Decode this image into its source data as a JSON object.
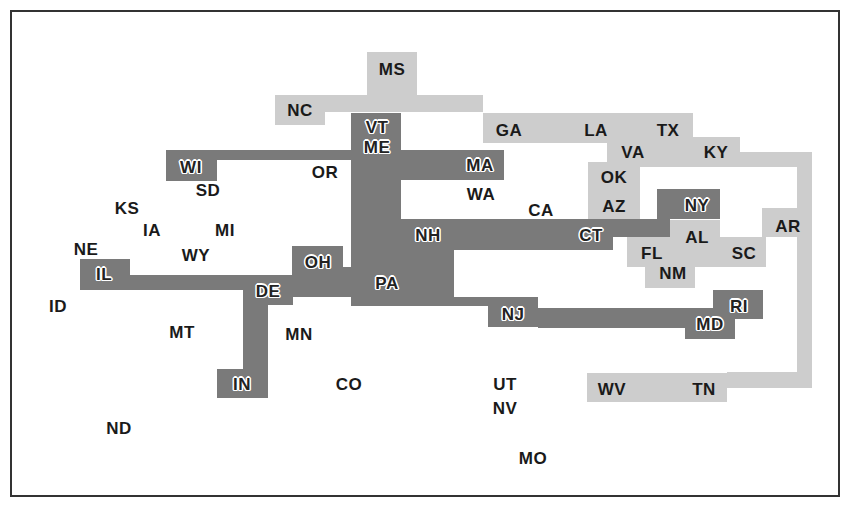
{
  "diagram": {
    "type": "region-cluster-map",
    "colors": {
      "dark_cluster": "#7a7a7a",
      "light_cluster": "#cdcdcd",
      "frame": "#333333",
      "text": "#1a1a1a"
    },
    "shapes": [
      {
        "cluster": "light",
        "x": 367,
        "y": 52,
        "w": 50,
        "h": 45
      },
      {
        "cluster": "light",
        "x": 275,
        "y": 95,
        "w": 208,
        "h": 17
      },
      {
        "cluster": "light",
        "x": 275,
        "y": 95,
        "w": 50,
        "h": 30
      },
      {
        "cluster": "light",
        "x": 483,
        "y": 113,
        "w": 210,
        "h": 30
      },
      {
        "cluster": "light",
        "x": 607,
        "y": 137,
        "w": 133,
        "h": 30
      },
      {
        "cluster": "light",
        "x": 740,
        "y": 152,
        "w": 72,
        "h": 15
      },
      {
        "cluster": "light",
        "x": 797,
        "y": 152,
        "w": 15,
        "h": 236
      },
      {
        "cluster": "light",
        "x": 588,
        "y": 162,
        "w": 52,
        "h": 58
      },
      {
        "cluster": "light",
        "x": 762,
        "y": 208,
        "w": 50,
        "h": 29
      },
      {
        "cluster": "light",
        "x": 670,
        "y": 220,
        "w": 50,
        "h": 47
      },
      {
        "cluster": "light",
        "x": 627,
        "y": 237,
        "w": 45,
        "h": 30
      },
      {
        "cluster": "light",
        "x": 720,
        "y": 237,
        "w": 46,
        "h": 30
      },
      {
        "cluster": "light",
        "x": 645,
        "y": 265,
        "w": 50,
        "h": 23
      },
      {
        "cluster": "light",
        "x": 727,
        "y": 372,
        "w": 85,
        "h": 16
      },
      {
        "cluster": "light",
        "x": 587,
        "y": 373,
        "w": 140,
        "h": 29
      },
      {
        "cluster": "dark",
        "x": 166,
        "y": 150,
        "w": 51,
        "h": 31
      },
      {
        "cluster": "dark",
        "x": 217,
        "y": 150,
        "w": 134,
        "h": 10
      },
      {
        "cluster": "dark",
        "x": 351,
        "y": 113,
        "w": 50,
        "h": 193
      },
      {
        "cluster": "dark",
        "x": 401,
        "y": 150,
        "w": 103,
        "h": 30
      },
      {
        "cluster": "dark",
        "x": 401,
        "y": 219,
        "w": 212,
        "h": 31
      },
      {
        "cluster": "dark",
        "x": 613,
        "y": 219,
        "w": 57,
        "h": 18
      },
      {
        "cluster": "dark",
        "x": 657,
        "y": 189,
        "w": 63,
        "h": 30
      },
      {
        "cluster": "dark",
        "x": 401,
        "y": 250,
        "w": 53,
        "h": 56
      },
      {
        "cluster": "dark",
        "x": 292,
        "y": 246,
        "w": 51,
        "h": 51
      },
      {
        "cluster": "dark",
        "x": 292,
        "y": 267,
        "w": 59,
        "h": 30
      },
      {
        "cluster": "dark",
        "x": 80,
        "y": 259,
        "w": 50,
        "h": 31
      },
      {
        "cluster": "dark",
        "x": 130,
        "y": 275,
        "w": 163,
        "h": 15
      },
      {
        "cluster": "dark",
        "x": 243,
        "y": 275,
        "w": 50,
        "h": 30
      },
      {
        "cluster": "dark",
        "x": 243,
        "y": 305,
        "w": 25,
        "h": 93
      },
      {
        "cluster": "dark",
        "x": 217,
        "y": 369,
        "w": 51,
        "h": 29
      },
      {
        "cluster": "dark",
        "x": 454,
        "y": 297,
        "w": 34,
        "h": 9
      },
      {
        "cluster": "dark",
        "x": 488,
        "y": 297,
        "w": 50,
        "h": 30
      },
      {
        "cluster": "dark",
        "x": 538,
        "y": 308,
        "w": 147,
        "h": 20
      },
      {
        "cluster": "dark",
        "x": 685,
        "y": 308,
        "w": 50,
        "h": 31
      },
      {
        "cluster": "dark",
        "x": 713,
        "y": 290,
        "w": 50,
        "h": 29
      }
    ],
    "labels": [
      {
        "text": "MS",
        "x": 392,
        "y": 69,
        "style": "light"
      },
      {
        "text": "NC",
        "x": 300,
        "y": 110,
        "style": "light"
      },
      {
        "text": "VT",
        "x": 377,
        "y": 127,
        "style": "dark"
      },
      {
        "text": "ME",
        "x": 377,
        "y": 147,
        "style": "dark"
      },
      {
        "text": "GA",
        "x": 509,
        "y": 130,
        "style": "light"
      },
      {
        "text": "LA",
        "x": 596,
        "y": 130,
        "style": "light"
      },
      {
        "text": "TX",
        "x": 668,
        "y": 130,
        "style": "light"
      },
      {
        "text": "VA",
        "x": 633,
        "y": 152,
        "style": "light"
      },
      {
        "text": "KY",
        "x": 716,
        "y": 152,
        "style": "light"
      },
      {
        "text": "WI",
        "x": 191,
        "y": 167,
        "style": "dark"
      },
      {
        "text": "OR",
        "x": 325,
        "y": 172,
        "style": "none"
      },
      {
        "text": "MA",
        "x": 480,
        "y": 165,
        "style": "dark"
      },
      {
        "text": "SD",
        "x": 208,
        "y": 190,
        "style": "none"
      },
      {
        "text": "WA",
        "x": 481,
        "y": 194,
        "style": "none"
      },
      {
        "text": "OK",
        "x": 614,
        "y": 177,
        "style": "light"
      },
      {
        "text": "KS",
        "x": 127,
        "y": 208,
        "style": "none"
      },
      {
        "text": "CA",
        "x": 541,
        "y": 210,
        "style": "none"
      },
      {
        "text": "AZ",
        "x": 614,
        "y": 206,
        "style": "light"
      },
      {
        "text": "NY",
        "x": 697,
        "y": 205,
        "style": "dark"
      },
      {
        "text": "AR",
        "x": 788,
        "y": 226,
        "style": "light"
      },
      {
        "text": "IA",
        "x": 152,
        "y": 230,
        "style": "none"
      },
      {
        "text": "MI",
        "x": 225,
        "y": 230,
        "style": "none"
      },
      {
        "text": "NH",
        "x": 428,
        "y": 235,
        "style": "dark"
      },
      {
        "text": "CT",
        "x": 591,
        "y": 235,
        "style": "dark"
      },
      {
        "text": "AL",
        "x": 697,
        "y": 237,
        "style": "light"
      },
      {
        "text": "NE",
        "x": 86,
        "y": 249,
        "style": "none"
      },
      {
        "text": "WY",
        "x": 196,
        "y": 255,
        "style": "none"
      },
      {
        "text": "FL",
        "x": 652,
        "y": 253,
        "style": "light"
      },
      {
        "text": "SC",
        "x": 744,
        "y": 253,
        "style": "light"
      },
      {
        "text": "OH",
        "x": 318,
        "y": 262,
        "style": "dark"
      },
      {
        "text": "IL",
        "x": 104,
        "y": 274,
        "style": "dark"
      },
      {
        "text": "NM",
        "x": 673,
        "y": 273,
        "style": "light"
      },
      {
        "text": "PA",
        "x": 387,
        "y": 283,
        "style": "dark"
      },
      {
        "text": "DE",
        "x": 268,
        "y": 291,
        "style": "dark"
      },
      {
        "text": "ID",
        "x": 58,
        "y": 306,
        "style": "none"
      },
      {
        "text": "RI",
        "x": 739,
        "y": 306,
        "style": "dark"
      },
      {
        "text": "NJ",
        "x": 513,
        "y": 314,
        "style": "dark"
      },
      {
        "text": "MD",
        "x": 710,
        "y": 324,
        "style": "dark"
      },
      {
        "text": "MT",
        "x": 182,
        "y": 332,
        "style": "none"
      },
      {
        "text": "MN",
        "x": 299,
        "y": 334,
        "style": "none"
      },
      {
        "text": "IN",
        "x": 242,
        "y": 384,
        "style": "dark"
      },
      {
        "text": "CO",
        "x": 349,
        "y": 384,
        "style": "none"
      },
      {
        "text": "UT",
        "x": 505,
        "y": 384,
        "style": "none"
      },
      {
        "text": "WV",
        "x": 612,
        "y": 389,
        "style": "light"
      },
      {
        "text": "TN",
        "x": 704,
        "y": 389,
        "style": "light"
      },
      {
        "text": "NV",
        "x": 505,
        "y": 408,
        "style": "none"
      },
      {
        "text": "ND",
        "x": 119,
        "y": 428,
        "style": "none"
      },
      {
        "text": "MO",
        "x": 533,
        "y": 458,
        "style": "none"
      }
    ]
  }
}
